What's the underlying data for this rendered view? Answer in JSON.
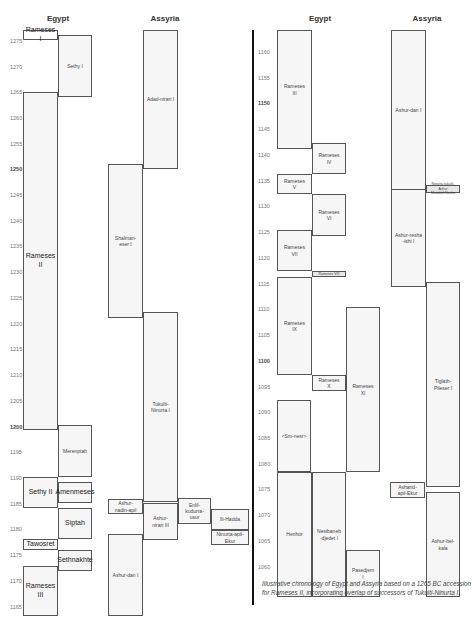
{
  "panels": [
    {
      "id": "left",
      "headers": {
        "egypt": "Egypt",
        "assyria": "Assyria"
      },
      "ticks": [
        {
          "label": "1275",
          "y": 42,
          "bold": false
        },
        {
          "label": "1270",
          "y": 68,
          "bold": false
        },
        {
          "label": "1265",
          "y": 93,
          "bold": false
        },
        {
          "label": "1260",
          "y": 119,
          "bold": false
        },
        {
          "label": "1255",
          "y": 145,
          "bold": false
        },
        {
          "label": "1250",
          "y": 170,
          "bold": true
        },
        {
          "label": "1245",
          "y": 196,
          "bold": false
        },
        {
          "label": "1240",
          "y": 222,
          "bold": false
        },
        {
          "label": "1235",
          "y": 247,
          "bold": false
        },
        {
          "label": "1230",
          "y": 273,
          "bold": false
        },
        {
          "label": "1225",
          "y": 299,
          "bold": false
        },
        {
          "label": "1220",
          "y": 325,
          "bold": false
        },
        {
          "label": "1215",
          "y": 350,
          "bold": false
        },
        {
          "label": "1210",
          "y": 376,
          "bold": false
        },
        {
          "label": "1205",
          "y": 402,
          "bold": false
        },
        {
          "label": "1200",
          "y": 428,
          "bold": true
        },
        {
          "label": "1195",
          "y": 453,
          "bold": false
        },
        {
          "label": "1190",
          "y": 479,
          "bold": false
        },
        {
          "label": "1185",
          "y": 505,
          "bold": false
        },
        {
          "label": "1180",
          "y": 530,
          "bold": false
        },
        {
          "label": "1175",
          "y": 556,
          "bold": false
        },
        {
          "label": "1170",
          "y": 582,
          "bold": false
        },
        {
          "label": "1165",
          "y": 608,
          "bold": false
        }
      ],
      "boxes": [
        {
          "label": "Rameses I",
          "x": 23,
          "y": 30,
          "w": 35,
          "h": 10,
          "style": "big white"
        },
        {
          "label": "Sethy I",
          "x": 58,
          "y": 35,
          "w": 34,
          "h": 62,
          "style": ""
        },
        {
          "label": "Rameses II",
          "x": 23,
          "y": 92,
          "w": 35,
          "h": 338,
          "style": "big"
        },
        {
          "label": "Merenptah",
          "x": 58,
          "y": 425,
          "w": 34,
          "h": 52,
          "style": ""
        },
        {
          "label": "Sethy II",
          "x": 23,
          "y": 477,
          "w": 35,
          "h": 31,
          "style": "big"
        },
        {
          "label": "Amenmeses",
          "x": 58,
          "y": 482,
          "w": 34,
          "h": 21,
          "style": "big"
        },
        {
          "label": "Siptah",
          "x": 58,
          "y": 508,
          "w": 34,
          "h": 31,
          "style": "big"
        },
        {
          "label": "Tawosret",
          "x": 23,
          "y": 539,
          "w": 35,
          "h": 11,
          "style": "big"
        },
        {
          "label": "Sethnakhte",
          "x": 58,
          "y": 550,
          "w": 34,
          "h": 21,
          "style": "big"
        },
        {
          "label": "Rameses III",
          "x": 23,
          "y": 566,
          "w": 35,
          "h": 50,
          "style": "big"
        },
        {
          "label": "Adad-nirari I",
          "x": 143,
          "y": 30,
          "w": 35,
          "h": 139,
          "style": ""
        },
        {
          "label": "Shalman-\neser I",
          "x": 108,
          "y": 164,
          "w": 35,
          "h": 154,
          "style": ""
        },
        {
          "label": "Tukulti-\nNinurta I",
          "x": 143,
          "y": 312,
          "w": 35,
          "h": 190,
          "style": ""
        },
        {
          "label": "Ashur-\nnadin-apil",
          "x": 108,
          "y": 499,
          "w": 35,
          "h": 15,
          "style": ""
        },
        {
          "label": "Ashur-\nnirari III",
          "x": 143,
          "y": 503,
          "w": 35,
          "h": 37,
          "style": ""
        },
        {
          "label": "Enlil-kudurra-\nusur",
          "x": 178,
          "y": 498,
          "w": 33,
          "h": 26,
          "style": ""
        },
        {
          "label": "Ili-Hadda",
          "x": 211,
          "y": 509,
          "w": 38,
          "h": 21,
          "style": ""
        },
        {
          "label": "Ninurta-apil-\nEkur",
          "x": 211,
          "y": 530,
          "w": 38,
          "h": 15,
          "style": ""
        },
        {
          "label": "Ashur-dan I",
          "x": 108,
          "y": 534,
          "w": 35,
          "h": 82,
          "style": ""
        }
      ]
    },
    {
      "id": "right",
      "headers": {
        "egypt": "Egypt",
        "assyria": "Assyria"
      },
      "ticks": [
        {
          "label": "1160",
          "y": 53,
          "bold": false
        },
        {
          "label": "1155",
          "y": 79,
          "bold": false
        },
        {
          "label": "1150",
          "y": 104,
          "bold": true
        },
        {
          "label": "1145",
          "y": 130,
          "bold": false
        },
        {
          "label": "1140",
          "y": 156,
          "bold": false
        },
        {
          "label": "1135",
          "y": 182,
          "bold": false
        },
        {
          "label": "1130",
          "y": 207,
          "bold": false
        },
        {
          "label": "1125",
          "y": 233,
          "bold": false
        },
        {
          "label": "1120",
          "y": 259,
          "bold": false
        },
        {
          "label": "1115",
          "y": 285,
          "bold": false
        },
        {
          "label": "1110",
          "y": 310,
          "bold": false
        },
        {
          "label": "1105",
          "y": 336,
          "bold": false
        },
        {
          "label": "1100",
          "y": 362,
          "bold": true
        },
        {
          "label": "1095",
          "y": 388,
          "bold": false
        },
        {
          "label": "1090",
          "y": 413,
          "bold": false
        },
        {
          "label": "1085",
          "y": 439,
          "bold": false
        },
        {
          "label": "1080",
          "y": 465,
          "bold": false
        },
        {
          "label": "1075",
          "y": 490,
          "bold": false
        },
        {
          "label": "1070",
          "y": 516,
          "bold": false
        },
        {
          "label": "1065",
          "y": 542,
          "bold": false
        },
        {
          "label": "1060",
          "y": 568,
          "bold": false
        }
      ],
      "boxes": [
        {
          "label": "Rameses\nIII",
          "x": 277,
          "y": 30,
          "w": 35,
          "h": 119,
          "style": ""
        },
        {
          "label": "Rameses\nIV",
          "x": 312,
          "y": 143,
          "w": 34,
          "h": 31,
          "style": ""
        },
        {
          "label": "Rameses\nV",
          "x": 277,
          "y": 174,
          "w": 35,
          "h": 20,
          "style": ""
        },
        {
          "label": "Rameses\nVI",
          "x": 312,
          "y": 194,
          "w": 34,
          "h": 42,
          "style": ""
        },
        {
          "label": "Rameses\nVII",
          "x": 277,
          "y": 230,
          "w": 35,
          "h": 41,
          "style": ""
        },
        {
          "label": "Rameses VIII",
          "x": 312,
          "y": 271,
          "w": 34,
          "h": 6,
          "style": "tiny"
        },
        {
          "label": "Rameses\nIX",
          "x": 277,
          "y": 277,
          "w": 35,
          "h": 98,
          "style": ""
        },
        {
          "label": "Rameses\nX",
          "x": 312,
          "y": 375,
          "w": 34,
          "h": 16,
          "style": ""
        },
        {
          "label": "Rameses\nXI",
          "x": 346,
          "y": 307,
          "w": 34,
          "h": 165,
          "style": ""
        },
        {
          "label": "<Sm-nesr>",
          "x": 277,
          "y": 400,
          "w": 34,
          "h": 72,
          "style": ""
        },
        {
          "label": "Herihor",
          "x": 277,
          "y": 472,
          "w": 35,
          "h": 125,
          "style": ""
        },
        {
          "label": "Nesibaneb\n-djedet I",
          "x": 312,
          "y": 472,
          "w": 34,
          "h": 125,
          "style": ""
        },
        {
          "label": "Pasedjem\nI",
          "x": 346,
          "y": 550,
          "w": 34,
          "h": 47,
          "style": ""
        },
        {
          "label": "Ashur-dan I",
          "x": 391,
          "y": 30,
          "w": 35,
          "h": 160,
          "style": ""
        },
        {
          "label": "Ninurta-tukulti-Ashur\nMutakkil-Nusku",
          "x": 426,
          "y": 185,
          "w": 34,
          "h": 8,
          "style": "tiny"
        },
        {
          "label": "Ashur-resha\n-ishi I",
          "x": 391,
          "y": 189,
          "w": 35,
          "h": 98,
          "style": ""
        },
        {
          "label": "Tiglath-\nPileser I",
          "x": 426,
          "y": 282,
          "w": 34,
          "h": 205,
          "style": ""
        },
        {
          "label": "Asharid-\napil-Ekur",
          "x": 390,
          "y": 482,
          "w": 35,
          "h": 16,
          "style": ""
        },
        {
          "label": "Ashur-bel-\nkala",
          "x": 426,
          "y": 492,
          "w": 34,
          "h": 105,
          "style": ""
        }
      ]
    }
  ],
  "caption": "Illustrative chronology of Egypt and Assyria based on a 1265 BC accession for Rameses II, incorporating overlap of successors of Tukulti-Ninurta I."
}
